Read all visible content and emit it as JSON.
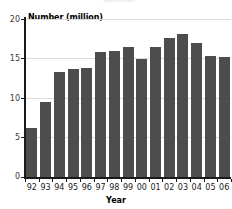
{
  "chart_data": {
    "type": "bar",
    "title": "",
    "cut_off_title_fragment": "Number",
    "xlabel": "Year",
    "ylabel": "Number (million)",
    "categories": [
      "92",
      "93",
      "94",
      "95",
      "96",
      "97",
      "98",
      "99",
      "00",
      "01",
      "02",
      "03",
      "04",
      "05",
      "06"
    ],
    "values": [
      6.2,
      9.5,
      13.3,
      13.7,
      13.8,
      15.8,
      16.0,
      16.5,
      14.9,
      16.4,
      17.6,
      18.1,
      17.0,
      15.3,
      15.2
    ],
    "ylim": [
      0,
      20
    ],
    "yticks": [
      "0",
      "5",
      "10",
      "15",
      "20"
    ],
    "ytick_values": [
      0,
      5,
      10,
      15,
      20
    ],
    "grid": true,
    "grid_axis": "y",
    "legend": false,
    "bar_color": "#4d4d4d",
    "grid_color": "#dcdcdc",
    "axis_color": "#1a1a1a",
    "background": "#ffffff"
  }
}
